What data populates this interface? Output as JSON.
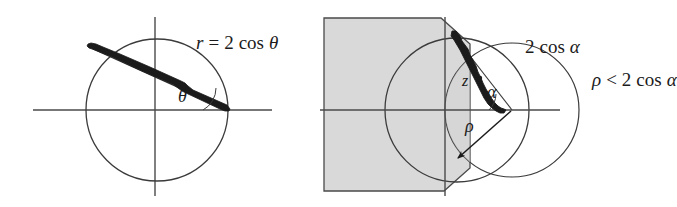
{
  "figure": {
    "background_color": "#ffffff",
    "ink_color": "#1b1b1b",
    "shade_color": "#d9d9d9",
    "panels": [
      {
        "name": "left-panel",
        "description": "Circle r = 2 cos theta with bold chord arc and angle theta at origin",
        "circle": {
          "cx": 157,
          "cy": 110,
          "r": 71
        },
        "axes": {
          "x_axis_y": 110,
          "y_axis_x": 155,
          "x_from": 33,
          "x_to": 272,
          "y_from": 17,
          "y_to": 196
        },
        "vertex": {
          "x": 228,
          "y": 110
        },
        "ray_end": {
          "x": 92,
          "y": 47
        },
        "angle_label": "theta"
      },
      {
        "name": "right-panel",
        "description": "Shaded region with cut corners, large circle, inner circle, angle alpha and radius rho",
        "shade_rect": {
          "x": 324,
          "y": 18,
          "w": 133,
          "h": 173
        },
        "big_circle": {
          "cx": 457,
          "cy": 110,
          "r": 72
        },
        "inner_circle": {
          "cx": 512,
          "cy": 110,
          "r": 67
        },
        "axes": {
          "x_axis_y": 110,
          "y_axis_x": 445,
          "x_from": 320,
          "x_to": 560,
          "y_from": 17,
          "y_to": 196
        },
        "vertex": {
          "x": 512,
          "y": 110
        },
        "z_point": {
          "x": 478,
          "y": 77
        }
      }
    ]
  },
  "labels": {
    "r_equation": {
      "var": "r",
      "rel": "=",
      "coef": "2",
      "fn": "cos",
      "arg": "θ",
      "full": "r = 2 cos θ"
    },
    "two_cos_alpha": {
      "coef": "2",
      "fn": "cos",
      "arg": "α",
      "full": "2 cos α"
    },
    "theta": "θ",
    "alpha": "α",
    "rho": "ρ",
    "z": "z",
    "inequality": {
      "var": "ρ",
      "rel": "<",
      "coef": "2",
      "fn": "cos",
      "arg": "α",
      "full": "ρ < 2 cos α",
      "clipped": true
    }
  }
}
